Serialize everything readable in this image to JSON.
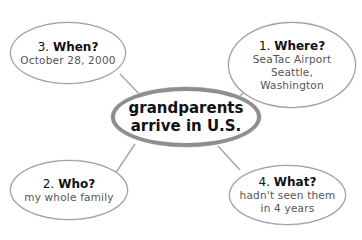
{
  "diagram": {
    "type": "web / 5W organizer",
    "center": {
      "text": "grandparents\narrive in U.S."
    },
    "nodes": [
      {
        "number": "1.",
        "question": "Where?",
        "answer": "SeaTac Airport\nSeattle,\nWashington"
      },
      {
        "number": "2.",
        "question": "Who?",
        "answer": "my whole family"
      },
      {
        "number": "3.",
        "question": "When?",
        "answer": "October 28, 2000"
      },
      {
        "number": "4.",
        "question": "What?",
        "answer": "hadn't seen them\nin 4 years"
      }
    ],
    "colors": {
      "border": "#9a9a9a",
      "center_border": "#8e8e8e",
      "line": "#a8a8a8",
      "answer_text": "#555555",
      "heading_text": "#111111"
    }
  }
}
